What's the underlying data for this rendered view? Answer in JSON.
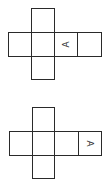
{
  "colors": {
    "line": "#2a2a2a",
    "background": "#ffffff",
    "glyph": "#333333"
  },
  "nets": [
    {
      "id": "net-1",
      "squares": [
        {
          "x": 31,
          "y": 8,
          "w": 24,
          "h": 25
        },
        {
          "x": 8,
          "y": 32,
          "w": 24,
          "h": 25
        },
        {
          "x": 31,
          "y": 32,
          "w": 24,
          "h": 25
        },
        {
          "x": 54,
          "y": 32,
          "w": 24,
          "h": 25
        },
        {
          "x": 77,
          "y": 32,
          "w": 25,
          "h": 25
        },
        {
          "x": 31,
          "y": 56,
          "w": 24,
          "h": 24
        }
      ],
      "label": {
        "text": "A",
        "x": 62,
        "y": 40,
        "rotation": -90
      }
    },
    {
      "id": "net-2",
      "squares": [
        {
          "x": 32,
          "y": 12,
          "w": 23,
          "h": 25
        },
        {
          "x": 9,
          "y": 36,
          "w": 24,
          "h": 25
        },
        {
          "x": 32,
          "y": 36,
          "w": 23,
          "h": 25
        },
        {
          "x": 54,
          "y": 36,
          "w": 25,
          "h": 25
        },
        {
          "x": 78,
          "y": 36,
          "w": 24,
          "h": 25
        },
        {
          "x": 32,
          "y": 60,
          "w": 23,
          "h": 24
        }
      ],
      "label": {
        "text": "A",
        "x": 85,
        "y": 44,
        "rotation": 90
      }
    }
  ]
}
